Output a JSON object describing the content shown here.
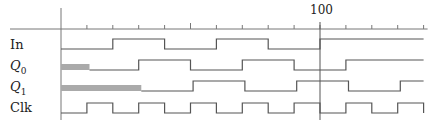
{
  "diagram": {
    "type": "timing-diagram",
    "time_axis": {
      "label_100": "100",
      "start": 0,
      "end": 140,
      "tick_step": 10,
      "origin_px": 61,
      "px_per_unit": 2.59,
      "marker_time": 100
    },
    "signals": [
      {
        "name": "In",
        "label": "In",
        "italic": false,
        "subscript": "",
        "segments": [
          [
            0,
            20,
            0
          ],
          [
            20,
            40,
            1
          ],
          [
            40,
            60,
            0
          ],
          [
            60,
            80,
            1
          ],
          [
            80,
            100,
            0
          ],
          [
            100,
            140,
            1
          ]
        ]
      },
      {
        "name": "Q0",
        "label": "Q",
        "italic": true,
        "subscript": "0",
        "segments": [
          [
            0,
            11,
            "x"
          ],
          [
            11,
            30,
            0
          ],
          [
            30,
            50,
            1
          ],
          [
            50,
            70,
            0
          ],
          [
            70,
            90,
            1
          ],
          [
            90,
            110,
            0
          ],
          [
            110,
            140,
            1
          ]
        ]
      },
      {
        "name": "Q1",
        "label": "Q",
        "italic": true,
        "subscript": "1",
        "segments": [
          [
            0,
            31,
            "x"
          ],
          [
            31,
            51,
            0
          ],
          [
            51,
            71,
            1
          ],
          [
            71,
            91,
            0
          ],
          [
            91,
            111,
            1
          ],
          [
            111,
            131,
            0
          ],
          [
            131,
            140,
            1
          ]
        ]
      },
      {
        "name": "Clk",
        "label": "Clk",
        "italic": false,
        "subscript": "",
        "segments": [
          [
            0,
            10,
            0
          ],
          [
            10,
            20,
            1
          ],
          [
            20,
            30,
            0
          ],
          [
            30,
            40,
            1
          ],
          [
            40,
            50,
            0
          ],
          [
            50,
            60,
            1
          ],
          [
            60,
            70,
            0
          ],
          [
            70,
            80,
            1
          ],
          [
            80,
            90,
            0
          ],
          [
            90,
            100,
            1
          ],
          [
            100,
            110,
            0
          ],
          [
            110,
            120,
            1
          ],
          [
            120,
            130,
            0
          ],
          [
            130,
            140,
            1
          ]
        ]
      }
    ],
    "colors": {
      "line": "#555555",
      "unknown_fill": "#aaaaaa",
      "text": "#222222"
    }
  }
}
